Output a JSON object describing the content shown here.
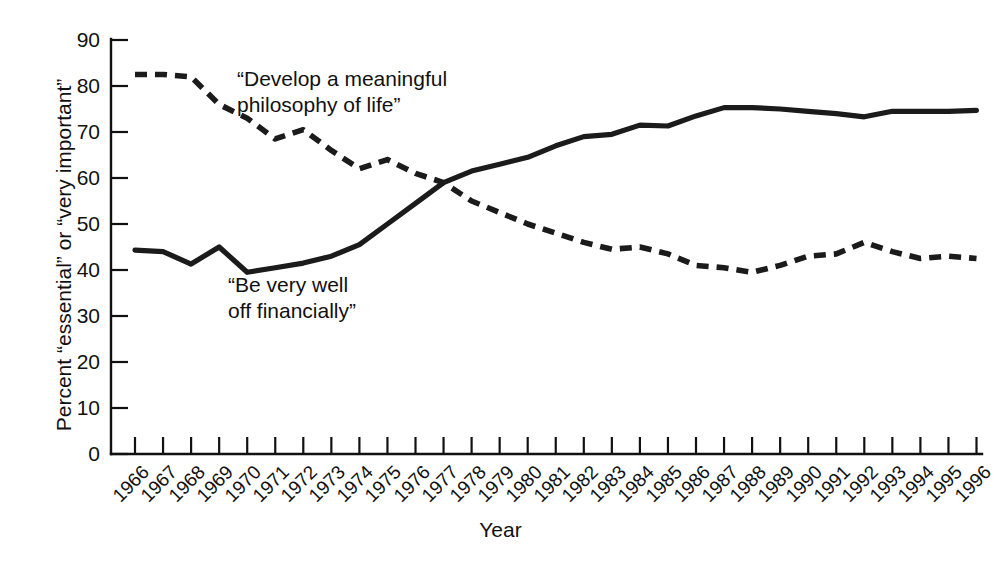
{
  "chart_data": {
    "type": "line",
    "title": "",
    "xlabel": "Year",
    "ylabel": "Percent “essential” or “very important”",
    "ylim": [
      0,
      90
    ],
    "ytick_step": 10,
    "grid": false,
    "legend_position": "inline-annotations",
    "categories": [
      "1966",
      "1967",
      "1968",
      "1969",
      "1970",
      "1971",
      "1972",
      "1973",
      "1974",
      "1975",
      "1976",
      "1977",
      "1978",
      "1979",
      "1980",
      "1981",
      "1982",
      "1983",
      "1984",
      "1985",
      "1986",
      "1987",
      "1988",
      "1989",
      "1990",
      "1991",
      "1992",
      "1993",
      "1994",
      "1995",
      "1996"
    ],
    "yticks": [
      "0",
      "10",
      "20",
      "30",
      "40",
      "50",
      "60",
      "70",
      "80",
      "90"
    ],
    "series": [
      {
        "name": "“Develop a meaningful philosophy of life”",
        "style": "dashed",
        "color": "#1b1b1b",
        "values": [
          82.5,
          82.5,
          82.0,
          76.0,
          73.0,
          68.5,
          70.5,
          66.0,
          62.0,
          64.0,
          61.0,
          59.0,
          55.0,
          52.5,
          50.0,
          48.0,
          46.0,
          44.5,
          45.0,
          43.5,
          41.0,
          40.5,
          39.5,
          41.0,
          43.0,
          43.5,
          46.0,
          44.0,
          42.5,
          43.0,
          42.5
        ]
      },
      {
        "name": "“Be very well off financially”",
        "style": "solid",
        "color": "#1b1b1b",
        "values": [
          44.3,
          44.0,
          41.3,
          45.0,
          39.5,
          40.5,
          41.5,
          43.0,
          45.5,
          50.0,
          54.5,
          59.0,
          61.5,
          63.0,
          64.5,
          67.0,
          69.0,
          69.5,
          71.5,
          71.3,
          73.5,
          75.3,
          75.3,
          75.0,
          74.5,
          74.0,
          73.3,
          74.5,
          74.5,
          74.5,
          74.7
        ]
      }
    ],
    "annotations": [
      {
        "id": "philosophy",
        "line1": "“Develop a meaningful",
        "line2": "philosophy of life”"
      },
      {
        "id": "financial",
        "line1": "“Be very well",
        "line2": "off financially”"
      }
    ]
  }
}
